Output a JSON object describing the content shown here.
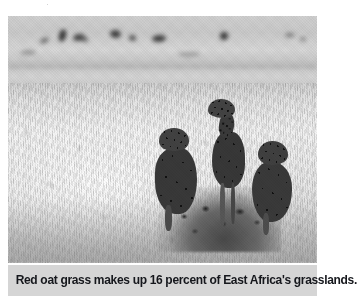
{
  "figure": {
    "type": "photograph",
    "medium": "black-and-white photograph",
    "alt_description": "Three cheetahs resting on a termite mound in tall sunlit savanna grass, with blurred distant animals on the horizon.",
    "subjects": [
      {
        "name": "cheetah-standing",
        "pose": "standing upright, head raised, looking right"
      },
      {
        "name": "cheetah-left",
        "pose": "sitting, facing left"
      },
      {
        "name": "cheetah-right",
        "pose": "sitting, head lowered"
      }
    ],
    "scene": {
      "foreground": "dry red oat grass",
      "midground": "termite mound",
      "background": "blurred horizon with distant animals"
    },
    "colors": {
      "caption_band": "#d5d5d5",
      "caption_text": "#15171c",
      "page_background": "#ffffff",
      "photo_highlight": "#f2f2f0",
      "photo_shadow": "#3a3836"
    }
  },
  "caption": {
    "text": "Red oat grass makes up 16 percent of East Africa's grasslands.",
    "subject": "Red oat grass",
    "percent": "16 percent",
    "region": "East Africa"
  },
  "clipped_line": {
    "text": "·"
  }
}
